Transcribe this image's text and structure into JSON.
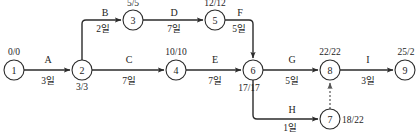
{
  "diagram": {
    "type": "pert-cpm-network",
    "title": "",
    "nodes": [
      {
        "id": "1",
        "label": "1",
        "time_label": "0/0",
        "cx": 14,
        "cy": 70,
        "r": 10,
        "label_pos": "above"
      },
      {
        "id": "2",
        "label": "2",
        "time_label": "3/3",
        "cx": 82,
        "cy": 70,
        "r": 10,
        "label_pos": "below"
      },
      {
        "id": "3",
        "label": "3",
        "time_label": "5/5",
        "cx": 133,
        "cy": 20,
        "r": 10,
        "label_pos": "above"
      },
      {
        "id": "4",
        "label": "4",
        "time_label": "10/10",
        "cx": 176,
        "cy": 70,
        "r": 10,
        "label_pos": "above"
      },
      {
        "id": "5",
        "label": "5",
        "time_label": "12/12",
        "cx": 215,
        "cy": 20,
        "r": 10,
        "label_pos": "above"
      },
      {
        "id": "6",
        "label": "6",
        "time_label": "17/17",
        "cx": 253,
        "cy": 70,
        "r": 10,
        "label_pos": "below-left"
      },
      {
        "id": "7",
        "label": "7",
        "time_label": "18/22",
        "cx": 330,
        "cy": 119,
        "r": 10,
        "label_pos": "right"
      },
      {
        "id": "8",
        "label": "8",
        "time_label": "22/22",
        "cx": 330,
        "cy": 70,
        "r": 10,
        "label_pos": "above"
      },
      {
        "id": "9",
        "label": "9",
        "time_label": "25/2",
        "cx": 405,
        "cy": 70,
        "r": 10,
        "label_pos": "above"
      }
    ],
    "activities": [
      {
        "id": "A",
        "name": "A",
        "duration": "3일",
        "from": "1",
        "to": "2",
        "name_x": 48,
        "name_y": 63,
        "dur_x": 48,
        "dur_y": 84
      },
      {
        "id": "B",
        "name": "B",
        "duration": "2일",
        "from": "2",
        "to": "3",
        "name_x": 105,
        "name_y": 16,
        "dur_x": 103,
        "dur_y": 32
      },
      {
        "id": "C",
        "name": "C",
        "duration": "7일",
        "from": "2",
        "to": "4",
        "name_x": 129,
        "name_y": 63,
        "dur_x": 129,
        "dur_y": 84
      },
      {
        "id": "D",
        "name": "D",
        "duration": "7일",
        "from": "3",
        "to": "5",
        "name_x": 174,
        "name_y": 16,
        "dur_x": 174,
        "dur_y": 32
      },
      {
        "id": "E",
        "name": "E",
        "duration": "7일",
        "from": "4",
        "to": "6",
        "name_x": 215,
        "name_y": 63,
        "dur_x": 215,
        "dur_y": 84
      },
      {
        "id": "F",
        "name": "F",
        "duration": "5일",
        "from": "5",
        "to": "6",
        "name_x": 240,
        "name_y": 16,
        "dur_x": 239,
        "dur_y": 32
      },
      {
        "id": "G",
        "name": "G",
        "duration": "5일",
        "from": "6",
        "to": "8",
        "name_x": 292,
        "name_y": 63,
        "dur_x": 292,
        "dur_y": 84
      },
      {
        "id": "H",
        "name": "H",
        "duration": "1일",
        "from": "6",
        "to": "7",
        "name_x": 292,
        "name_y": 113,
        "dur_x": 290,
        "dur_y": 131
      },
      {
        "id": "I",
        "name": "I",
        "duration": "3일",
        "from": "8",
        "to": "9",
        "name_x": 368,
        "name_y": 63,
        "dur_x": 368,
        "dur_y": 84
      }
    ],
    "dummy_activity": {
      "from": "7",
      "to": "8",
      "style": "dashed",
      "name": "",
      "duration": ""
    },
    "colors": {
      "stroke": "#2b2b2b",
      "dashed_stroke": "#555555",
      "text": "#1d1d1d",
      "background": "#ffffff"
    }
  }
}
